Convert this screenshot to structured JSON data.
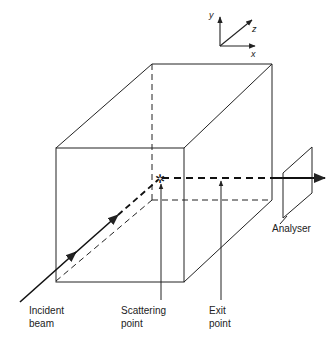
{
  "axes": {
    "y": "y",
    "z": "z",
    "x": "x"
  },
  "labels": {
    "analyser": "Analyser",
    "incident_1": "Incident",
    "incident_2": "beam",
    "scattering_1": "Scattering",
    "scattering_2": "point",
    "exit_1": "Exit",
    "exit_2": "point"
  },
  "colors": {
    "line": "#222222",
    "background": "#ffffff"
  }
}
